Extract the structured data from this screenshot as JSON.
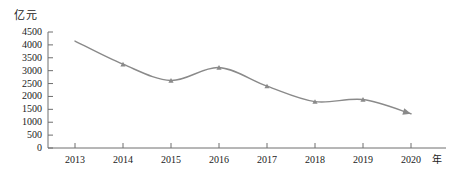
{
  "chart_data": {
    "type": "line",
    "title": "",
    "xlabel": "年",
    "ylabel": "亿元",
    "categories": [
      "2013",
      "2014",
      "2015",
      "2016",
      "2017",
      "2018",
      "2019",
      "2020"
    ],
    "values": [
      4150,
      3250,
      2620,
      3120,
      2400,
      1800,
      1880,
      1330
    ],
    "series": [
      {
        "name": "",
        "values": [
          4150,
          3250,
          2620,
          3120,
          2400,
          1800,
          1880,
          1330
        ]
      }
    ],
    "ylim": [
      0,
      4500
    ],
    "y_ticks": [
      0,
      500,
      1000,
      1500,
      2000,
      2500,
      3000,
      3500,
      4000,
      4500
    ],
    "y_tick_labels": [
      "0",
      "500",
      "1000",
      "1500",
      "2000",
      "2500",
      "3000",
      "3500",
      "4000",
      "4500"
    ],
    "x_tick_labels": [
      "2013",
      "2014",
      "2015",
      "2016",
      "2017",
      "2018",
      "2019",
      "2020"
    ],
    "grid": false,
    "legend": null,
    "legend_position": "none",
    "line_color": "#8a8a8a",
    "axis_color": "#6e6e6e",
    "text_color": "#1a1a1a",
    "marker": "triangle",
    "end_arrow": true,
    "smooth": true
  },
  "axis": {
    "y_unit": "亿元",
    "x_unit": "年"
  }
}
